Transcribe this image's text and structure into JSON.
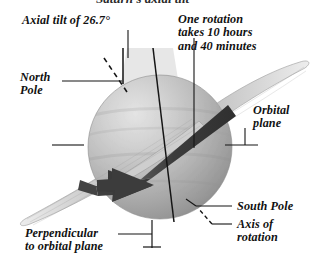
{
  "figure": {
    "cropped_title_fragment": "Saturn's axial tilt",
    "background_color": "#ffffff",
    "ink_color": "#111111"
  },
  "labels": {
    "axial_tilt": "Axial tilt of 26.7°",
    "one_rotation": "One rotation\ntakes 10 hours\nand 40 minutes",
    "north_pole": "North\nPole",
    "orbital_plane": "Orbital\nplane",
    "south_pole": "South Pole",
    "axis_of_rotation": "Axis of\nrotation",
    "perpendicular": "Perpendicular\nto orbital plane"
  },
  "planet": {
    "name": "saturn-sphere",
    "center_x": 160,
    "center_y": 147,
    "radius": 72,
    "highlight_color": "#d8d8d8",
    "mid_color": "#b4b4b4",
    "shadow_color": "#8e8e8e"
  },
  "rings": {
    "name": "saturn-rings",
    "color": "#d2d2d2",
    "outline_color": "#9a9a9a"
  },
  "rotation_band": {
    "name": "rotation-direction-arrow",
    "color": "#3a3a3a",
    "direction": "eastward"
  },
  "tilt_wedge": {
    "name": "axial-tilt-wedge",
    "color": "#e2e2e2",
    "angle_degrees": 26.7
  }
}
